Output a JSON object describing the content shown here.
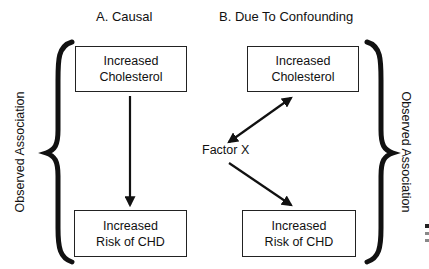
{
  "panels": {
    "a": {
      "title": "A. Causal",
      "top_box": [
        "Increased",
        "Cholesterol"
      ],
      "bottom_box": [
        "Increased",
        "Risk of CHD"
      ]
    },
    "b": {
      "title": "B. Due To Confounding",
      "top_box": [
        "Increased",
        "Cholesterol"
      ],
      "bottom_box": [
        "Increased",
        "Risk of CHD"
      ],
      "confounder": "Factor X"
    }
  },
  "side_labels": {
    "left": "Observed Association",
    "right": "Observed Association"
  },
  "colors": {
    "ink": "#111111",
    "background": "#ffffff"
  }
}
